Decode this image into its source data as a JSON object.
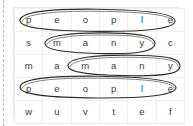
{
  "puzzle": {
    "type": "word-search-grid",
    "rows": 5,
    "columns": 6,
    "grid": [
      {
        "row_index": 1,
        "letters": [
          "p",
          "e",
          "o",
          "p",
          "l",
          "e"
        ]
      },
      {
        "row_index": 2,
        "letters": [
          "s",
          "m",
          "a",
          "n",
          "y",
          "c"
        ]
      },
      {
        "row_index": 3,
        "letters": [
          "m",
          "a",
          "m",
          "a",
          "n",
          "y"
        ]
      },
      {
        "row_index": 4,
        "letters": [
          "p",
          "e",
          "o",
          "p",
          "l",
          "e"
        ]
      },
      {
        "row_index": 5,
        "letters": [
          "w",
          "u",
          "v",
          "t",
          "e",
          "f"
        ]
      }
    ],
    "circled_words": [
      {
        "word": "people",
        "row": 1,
        "start_column": 1,
        "end_column": 6
      },
      {
        "word": "many",
        "row": 2,
        "start_column": 2,
        "end_column": 5
      },
      {
        "word": "many",
        "row": 3,
        "start_column": 3,
        "end_column": 6
      },
      {
        "word": "people",
        "row": 4,
        "start_column": 1,
        "end_column": 6
      }
    ],
    "colors": {
      "background": "#ffffff",
      "letter": "#3a3a3a",
      "cell_border": "#efefef",
      "table_border": "#e6e6e6",
      "ellipse": "#2e2e2e",
      "guide_line": "#b9b9b9"
    }
  }
}
